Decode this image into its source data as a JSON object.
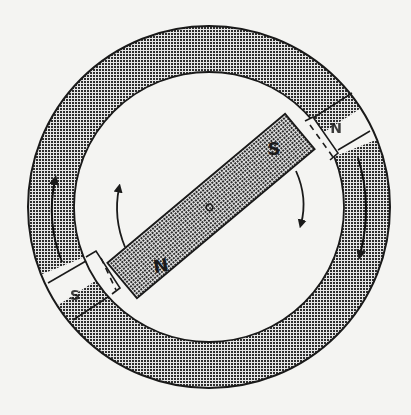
{
  "diagram": {
    "type": "magnetic rotor in stator ring",
    "colors": {
      "background": "#f4f4f2",
      "outline": "#1a1a1a",
      "hatch_dark": "#2b2b2b",
      "hatch_light": "#e8e8e8"
    },
    "stator": {
      "center": [
        209,
        207
      ],
      "outer_radius": 181,
      "inner_radius": 135,
      "poles": [
        {
          "label": "N",
          "angle_deg": -32
        },
        {
          "label": "S",
          "angle_deg": 148
        }
      ]
    },
    "rotor": {
      "center": [
        211,
        206
      ],
      "length": 232,
      "width": 46,
      "angle_deg": -40,
      "labels": {
        "north_end": "N",
        "south_end": "S"
      }
    },
    "arrows": [
      {
        "name": "rotor-rotation-right",
        "direction": "clockwise-down"
      },
      {
        "name": "rotor-rotation-left",
        "direction": "clockwise-up"
      },
      {
        "name": "stator-ring-right",
        "direction": "down"
      },
      {
        "name": "stator-ring-left",
        "direction": "up"
      }
    ]
  }
}
